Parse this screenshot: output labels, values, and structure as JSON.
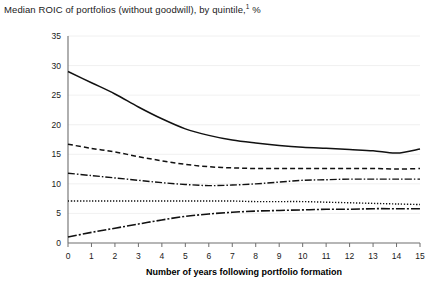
{
  "chart_data": {
    "type": "line",
    "title": "Median ROIC of portfolios (without goodwill), by quintile,",
    "title_footnote_marker": "1",
    "title_suffix": " %",
    "xlabel": "Number of years following portfolio formation",
    "ylabel": "",
    "xlim": [
      0,
      15
    ],
    "ylim": [
      0,
      35
    ],
    "grid": true,
    "legend_position": "none",
    "x": [
      0,
      1,
      2,
      3,
      4,
      5,
      6,
      7,
      8,
      9,
      10,
      11,
      12,
      13,
      14,
      15
    ],
    "xticks": [
      "0",
      "1",
      "2",
      "3",
      "4",
      "5",
      "6",
      "7",
      "8",
      "9",
      "10",
      "11",
      "12",
      "13",
      "14",
      "15"
    ],
    "yticks": [
      "0",
      "5",
      "10",
      "15",
      "20",
      "25",
      "30",
      "35"
    ],
    "series": [
      {
        "name": "Top quintile",
        "style": "solid",
        "values": [
          29.0,
          27.1,
          25.2,
          23.0,
          21.0,
          19.3,
          18.2,
          17.4,
          16.9,
          16.5,
          16.2,
          16.0,
          15.8,
          15.6,
          15.2,
          15.9
        ]
      },
      {
        "name": "Second quintile",
        "style": "dashed",
        "values": [
          16.7,
          16.0,
          15.4,
          14.6,
          13.9,
          13.3,
          12.9,
          12.7,
          12.6,
          12.6,
          12.6,
          12.6,
          12.6,
          12.6,
          12.5,
          12.6
        ]
      },
      {
        "name": "Third quintile",
        "style": "dash-dot",
        "values": [
          11.8,
          11.4,
          11.0,
          10.6,
          10.2,
          9.9,
          9.7,
          9.8,
          10.0,
          10.3,
          10.6,
          10.7,
          10.8,
          10.8,
          10.8,
          10.8
        ]
      },
      {
        "name": "Fourth quintile",
        "style": "dotted",
        "values": [
          7.1,
          7.1,
          7.1,
          7.1,
          7.1,
          7.1,
          7.1,
          7.1,
          7.0,
          7.0,
          7.0,
          6.9,
          6.8,
          6.7,
          6.6,
          6.5
        ]
      },
      {
        "name": "Bottom quintile",
        "style": "dash-dot-long",
        "values": [
          1.0,
          1.8,
          2.5,
          3.2,
          3.9,
          4.5,
          4.9,
          5.2,
          5.4,
          5.5,
          5.6,
          5.7,
          5.7,
          5.8,
          5.8,
          5.8
        ]
      }
    ]
  }
}
